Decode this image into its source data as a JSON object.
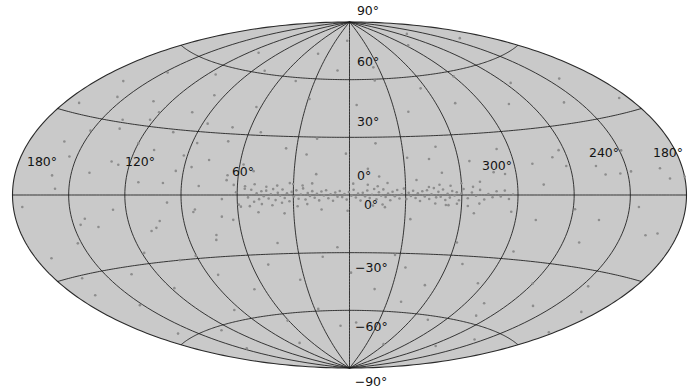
{
  "figure": {
    "type": "all-sky-scatter",
    "projection": "Aitoff",
    "coordinate_system": "Galactic",
    "background_color": "#c9c9c9",
    "grid_color": "#1a1a1a",
    "point_color": "#8d8d8d",
    "outline_color": "#2a2a2a",
    "page_background": "#ffffff"
  },
  "labels": {
    "longitude": [
      {
        "name": "lon-180-left",
        "text": "180°",
        "x": 42,
        "y": 166,
        "anchor": "middle"
      },
      {
        "name": "lon-120",
        "text": "120°",
        "x": 140,
        "y": 166,
        "anchor": "middle"
      },
      {
        "name": "lon-60",
        "text": "60°",
        "x": 243,
        "y": 176,
        "anchor": "middle"
      },
      {
        "name": "lon-0",
        "text": "0°",
        "x": 371,
        "y": 209,
        "anchor": "middle"
      },
      {
        "name": "lon-300",
        "text": "300°",
        "x": 497,
        "y": 170,
        "anchor": "middle"
      },
      {
        "name": "lon-240",
        "text": "240°",
        "x": 604,
        "y": 157,
        "anchor": "middle"
      },
      {
        "name": "lon-180-right",
        "text": "180°",
        "x": 668,
        "y": 157,
        "anchor": "middle"
      }
    ],
    "latitude": [
      {
        "name": "lat-90",
        "text": "90°",
        "x": 368,
        "y": 15,
        "anchor": "middle"
      },
      {
        "name": "lat-60",
        "text": "60°",
        "x": 357,
        "y": 66,
        "anchor": "start"
      },
      {
        "name": "lat-30",
        "text": "30°",
        "x": 357,
        "y": 126,
        "anchor": "start"
      },
      {
        "name": "lat-0",
        "text": "0°",
        "x": 357,
        "y": 180,
        "anchor": "start"
      },
      {
        "name": "lat-m30",
        "text": "−30°",
        "x": 355,
        "y": 272,
        "anchor": "start"
      },
      {
        "name": "lat-m60",
        "text": "−60°",
        "x": 355,
        "y": 331,
        "anchor": "start"
      },
      {
        "name": "lat-m90",
        "text": "−90°",
        "x": 371,
        "y": 386,
        "anchor": "middle"
      }
    ]
  },
  "chart_data": {
    "type": "scatter",
    "title": "",
    "xlabel": "Galactic longitude",
    "ylabel": "Galactic latitude",
    "projection": "Aitoff",
    "xlim": [
      180,
      -180
    ],
    "ylim": [
      -90,
      90
    ],
    "grid": true,
    "legend": null,
    "lon_gridlines": [
      180,
      150,
      120,
      90,
      60,
      30,
      0,
      330,
      300,
      270,
      240,
      210
    ],
    "lat_gridlines": [
      60,
      30,
      0,
      -30,
      -60
    ],
    "lon_ticks": [
      180,
      120,
      60,
      0,
      300,
      240,
      180
    ],
    "lat_ticks": [
      90,
      60,
      30,
      0,
      -30,
      -60,
      -90
    ],
    "point_count": 336,
    "marker_size_px": 2.6,
    "points": [
      [
        168.4,
        12.6
      ],
      [
        175.2,
        -4.1
      ],
      [
        161.0,
        19.8
      ],
      [
        157.4,
        2.3
      ],
      [
        150.9,
        25.1
      ],
      [
        146.2,
        -11.7
      ],
      [
        171.6,
        -22.4
      ],
      [
        164.8,
        -31.0
      ],
      [
        152.1,
        -18.6
      ],
      [
        140.3,
        8.9
      ],
      [
        135.6,
        27.5
      ],
      [
        130.2,
        14.0
      ],
      [
        126.9,
        -6.2
      ],
      [
        122.4,
        32.8
      ],
      [
        118.7,
        -25.3
      ],
      [
        113.2,
        5.6
      ],
      [
        109.5,
        20.1
      ],
      [
        105.8,
        -14.8
      ],
      [
        101.2,
        38.4
      ],
      [
        97.6,
        -3.5
      ],
      [
        94.1,
        11.2
      ],
      [
        90.5,
        -28.7
      ],
      [
        87.2,
        24.6
      ],
      [
        84.0,
        -8.1
      ],
      [
        80.7,
        4.3
      ],
      [
        77.4,
        16.9
      ],
      [
        74.1,
        -19.4
      ],
      [
        71.0,
        33.2
      ],
      [
        68.2,
        -2.0
      ],
      [
        65.8,
        9.7
      ],
      [
        63.1,
        -12.3
      ],
      [
        60.6,
        1.4
      ],
      [
        58.2,
        -5.8
      ],
      [
        56.0,
        3.1
      ],
      [
        54.2,
        -1.2
      ],
      [
        52.5,
        2.6
      ],
      [
        51.0,
        -3.4
      ],
      [
        49.6,
        0.8
      ],
      [
        48.3,
        -2.1
      ],
      [
        47.1,
        1.9
      ],
      [
        45.8,
        -0.6
      ],
      [
        44.5,
        2.2
      ],
      [
        43.2,
        -1.8
      ],
      [
        42.0,
        0.4
      ],
      [
        40.8,
        3.0
      ],
      [
        39.5,
        -2.6
      ],
      [
        38.3,
        1.1
      ],
      [
        37.0,
        -0.3
      ],
      [
        35.8,
        2.8
      ],
      [
        34.6,
        -1.5
      ],
      [
        33.4,
        0.9
      ],
      [
        32.1,
        -3.2
      ],
      [
        30.9,
        1.6
      ],
      [
        29.7,
        -0.8
      ],
      [
        28.4,
        2.4
      ],
      [
        27.2,
        -1.9
      ],
      [
        26.0,
        0.2
      ],
      [
        24.8,
        3.4
      ],
      [
        23.5,
        -2.3
      ],
      [
        22.3,
        1.0
      ],
      [
        21.1,
        -0.5
      ],
      [
        19.9,
        2.0
      ],
      [
        18.6,
        -1.4
      ],
      [
        17.4,
        0.6
      ],
      [
        16.2,
        -2.8
      ],
      [
        15.0,
        1.8
      ],
      [
        13.7,
        -0.2
      ],
      [
        12.5,
        2.5
      ],
      [
        11.3,
        -1.7
      ],
      [
        10.1,
        0.3
      ],
      [
        8.8,
        -3.0
      ],
      [
        7.6,
        1.3
      ],
      [
        6.4,
        -0.9
      ],
      [
        5.2,
        2.1
      ],
      [
        3.9,
        -1.1
      ],
      [
        2.7,
        0.5
      ],
      [
        1.5,
        -2.4
      ],
      [
        0.3,
        1.5
      ],
      [
        -1.0,
        -0.4
      ],
      [
        -2.2,
        2.7
      ],
      [
        -3.4,
        -1.3
      ],
      [
        -4.6,
        0.7
      ],
      [
        -5.9,
        -2.9
      ],
      [
        -7.1,
        1.2
      ],
      [
        -8.3,
        -0.7
      ],
      [
        -9.5,
        2.3
      ],
      [
        -10.8,
        -1.6
      ],
      [
        -12.0,
        0.1
      ],
      [
        -13.2,
        3.1
      ],
      [
        -14.4,
        -2.2
      ],
      [
        -15.7,
        1.4
      ],
      [
        -16.9,
        -0.3
      ],
      [
        -18.1,
        2.9
      ],
      [
        -19.3,
        -1.0
      ],
      [
        -20.6,
        0.8
      ],
      [
        -21.8,
        -2.7
      ],
      [
        -23.0,
        1.7
      ],
      [
        -24.2,
        -0.6
      ],
      [
        -25.5,
        2.6
      ],
      [
        -26.7,
        -1.8
      ],
      [
        -27.9,
        0.4
      ],
      [
        -29.1,
        3.3
      ],
      [
        -30.4,
        -2.1
      ],
      [
        -31.6,
        1.1
      ],
      [
        -32.8,
        -0.5
      ],
      [
        -34.0,
        2.2
      ],
      [
        -35.3,
        -1.5
      ],
      [
        -36.5,
        0.9
      ],
      [
        -37.7,
        -3.1
      ],
      [
        -38.9,
        1.9
      ],
      [
        -40.2,
        -0.8
      ],
      [
        -41.4,
        2.4
      ],
      [
        -42.6,
        -2.0
      ],
      [
        -43.8,
        0.3
      ],
      [
        -45.1,
        3.5
      ],
      [
        -46.3,
        -1.2
      ],
      [
        -47.5,
        1.6
      ],
      [
        -48.7,
        -0.9
      ],
      [
        -50.0,
        2.8
      ],
      [
        -51.2,
        -2.5
      ],
      [
        -52.4,
        0.6
      ],
      [
        -53.6,
        -1.3
      ],
      [
        -54.9,
        2.0
      ],
      [
        -56.1,
        -0.2
      ],
      [
        -57.3,
        1.4
      ],
      [
        -58.5,
        -2.6
      ],
      [
        -59.8,
        0.7
      ],
      [
        -61.0,
        3.0
      ],
      [
        -63.2,
        -1.6
      ],
      [
        -65.4,
        1.2
      ],
      [
        -67.6,
        -0.4
      ],
      [
        -69.8,
        2.5
      ],
      [
        -72.0,
        -2.2
      ],
      [
        -74.2,
        0.5
      ],
      [
        -76.4,
        -1.1
      ],
      [
        -78.6,
        1.8
      ],
      [
        -80.8,
        -0.7
      ],
      [
        -83.0,
        2.1
      ],
      [
        -85.2,
        -1.9
      ],
      [
        -87.4,
        0.2
      ],
      [
        165.0,
        44.2
      ],
      [
        148.0,
        51.6
      ],
      [
        131.0,
        40.3
      ],
      [
        114.0,
        55.8
      ],
      [
        97.0,
        47.1
      ],
      [
        80.0,
        61.4
      ],
      [
        63.0,
        43.9
      ],
      [
        46.0,
        58.2
      ],
      [
        29.0,
        49.5
      ],
      [
        12.0,
        64.7
      ],
      [
        -5.0,
        46.8
      ],
      [
        -22.0,
        59.3
      ],
      [
        -39.0,
        42.6
      ],
      [
        -56.0,
        53.9
      ],
      [
        -73.0,
        45.2
      ],
      [
        -90.0,
        57.5
      ],
      [
        -107.0,
        41.8
      ],
      [
        -124.0,
        50.1
      ],
      [
        -141.0,
        38.4
      ],
      [
        -158.0,
        46.7
      ],
      [
        -175.0,
        35.0
      ],
      [
        172.0,
        33.5
      ],
      [
        155.0,
        38.8
      ],
      [
        138.0,
        31.1
      ],
      [
        121.0,
        36.4
      ],
      [
        104.0,
        28.7
      ],
      [
        87.0,
        34.0
      ],
      [
        70.0,
        26.3
      ],
      [
        53.0,
        31.6
      ],
      [
        36.0,
        23.9
      ],
      [
        19.0,
        29.2
      ],
      [
        2.0,
        21.5
      ],
      [
        -15.0,
        26.8
      ],
      [
        -32.0,
        19.1
      ],
      [
        -49.0,
        24.4
      ],
      [
        -66.0,
        16.7
      ],
      [
        -83.0,
        22.0
      ],
      [
        -100.0,
        14.3
      ],
      [
        -117.0,
        19.6
      ],
      [
        -134.0,
        11.9
      ],
      [
        -151.0,
        17.2
      ],
      [
        -168.0,
        9.5
      ],
      [
        160.0,
        7.2
      ],
      [
        143.0,
        -9.4
      ],
      [
        126.0,
        12.8
      ],
      [
        109.0,
        -16.1
      ],
      [
        92.0,
        18.5
      ],
      [
        75.0,
        -21.8
      ],
      [
        58.0,
        15.2
      ],
      [
        41.0,
        -24.5
      ],
      [
        24.0,
        20.9
      ],
      [
        7.0,
        -27.2
      ],
      [
        -10.0,
        13.6
      ],
      [
        -27.0,
        -30.9
      ],
      [
        -44.0,
        18.3
      ],
      [
        -61.0,
        -23.6
      ],
      [
        -78.0,
        11.0
      ],
      [
        -95.0,
        -26.3
      ],
      [
        -112.0,
        16.7
      ],
      [
        -129.0,
        -20.0
      ],
      [
        -146.0,
        8.4
      ],
      [
        -163.0,
        -14.7
      ],
      [
        -180.0,
        6.1
      ],
      [
        169.0,
        -37.4
      ],
      [
        152.0,
        -44.8
      ],
      [
        135.0,
        -33.2
      ],
      [
        118.0,
        -41.6
      ],
      [
        101.0,
        -30.0
      ],
      [
        84.0,
        -38.4
      ],
      [
        67.0,
        -46.8
      ],
      [
        50.0,
        -35.2
      ],
      [
        33.0,
        -43.6
      ],
      [
        16.0,
        -32.0
      ],
      [
        -1.0,
        -40.4
      ],
      [
        -18.0,
        -48.8
      ],
      [
        -35.0,
        -37.2
      ],
      [
        -52.0,
        -45.6
      ],
      [
        -69.0,
        -34.0
      ],
      [
        -86.0,
        -42.4
      ],
      [
        -103.0,
        -50.8
      ],
      [
        -120.0,
        -39.2
      ],
      [
        -137.0,
        -47.6
      ],
      [
        -154.0,
        -36.0
      ],
      [
        -171.0,
        -44.4
      ],
      [
        163.0,
        -57.3
      ],
      [
        129.0,
        -61.7
      ],
      [
        95.0,
        -55.1
      ],
      [
        61.0,
        -63.5
      ],
      [
        27.0,
        -58.9
      ],
      [
        -7.0,
        -66.3
      ],
      [
        -41.0,
        -54.7
      ],
      [
        -75.0,
        -62.1
      ],
      [
        -109.0,
        -56.5
      ],
      [
        -143.0,
        -64.9
      ],
      [
        -177.0,
        -53.3
      ],
      [
        146.0,
        -70.2
      ],
      [
        78.0,
        -74.6
      ],
      [
        10.0,
        -68.0
      ],
      [
        -58.0,
        -76.4
      ],
      [
        -126.0,
        -71.8
      ],
      [
        111.0,
        68.3
      ],
      [
        43.0,
        72.7
      ],
      [
        -25.0,
        66.1
      ],
      [
        -93.0,
        74.5
      ],
      [
        -161.0,
        69.9
      ],
      [
        5.0,
        80.2
      ],
      [
        -130.0,
        78.6
      ],
      [
        100.0,
        5.5
      ],
      [
        83.0,
        -6.9
      ],
      [
        66.0,
        7.3
      ],
      [
        49.0,
        -8.7
      ],
      [
        32.0,
        6.1
      ],
      [
        15.0,
        -7.5
      ],
      [
        -2.0,
        5.9
      ],
      [
        -19.0,
        -6.3
      ],
      [
        -36.0,
        7.7
      ],
      [
        -53.0,
        -5.1
      ],
      [
        -70.0,
        6.5
      ],
      [
        -87.0,
        -7.9
      ],
      [
        -104.0,
        4.7
      ],
      [
        -121.0,
        -6.1
      ],
      [
        -138.0,
        8.3
      ],
      [
        -155.0,
        -4.5
      ],
      [
        -172.0,
        5.7
      ],
      [
        154.0,
        14.6
      ],
      [
        137.0,
        -13.0
      ],
      [
        120.0,
        22.4
      ],
      [
        103.0,
        -11.8
      ],
      [
        86.0,
        13.2
      ],
      [
        69.0,
        -10.6
      ],
      [
        52.0,
        12.0
      ],
      [
        35.0,
        -9.4
      ],
      [
        18.0,
        10.8
      ],
      [
        1.0,
        -8.2
      ],
      [
        -16.0,
        9.6
      ],
      [
        -33.0,
        -12.4
      ],
      [
        -50.0,
        11.2
      ],
      [
        -67.0,
        -9.0
      ],
      [
        -84.0,
        10.0
      ],
      [
        -101.0,
        -11.4
      ],
      [
        -118.0,
        12.6
      ],
      [
        -135.0,
        -10.2
      ],
      [
        -152.0,
        9.0
      ],
      [
        -169.0,
        -13.6
      ],
      [
        44.5,
        4.2
      ],
      [
        46.9,
        -4.6
      ],
      [
        41.3,
        -5.2
      ],
      [
        38.7,
        4.8
      ],
      [
        36.1,
        -4.0
      ],
      [
        50.8,
        5.4
      ],
      [
        53.4,
        -5.6
      ],
      [
        55.9,
        4.4
      ],
      [
        59.3,
        -4.8
      ],
      [
        62.0,
        5.0
      ],
      [
        -42.5,
        4.1
      ],
      [
        -45.9,
        -4.3
      ],
      [
        -48.2,
        5.2
      ],
      [
        -51.6,
        -5.0
      ],
      [
        -54.1,
        4.6
      ],
      [
        -57.5,
        -4.4
      ],
      [
        -60.0,
        5.8
      ],
      [
        -63.4,
        -5.4
      ],
      [
        -66.1,
        4.0
      ],
      [
        -69.5,
        -4.2
      ],
      [
        30.2,
        5.6
      ],
      [
        27.8,
        -5.8
      ],
      [
        25.1,
        4.9
      ],
      [
        22.6,
        -4.7
      ],
      [
        20.0,
        6.0
      ],
      [
        -9.8,
        5.3
      ],
      [
        -12.6,
        -5.5
      ],
      [
        -15.1,
        4.5
      ],
      [
        -17.7,
        -4.9
      ],
      [
        -20.4,
        6.2
      ]
    ]
  }
}
